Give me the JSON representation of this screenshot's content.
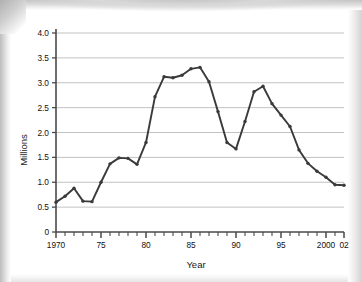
{
  "chart_data": {
    "type": "line",
    "title": "",
    "xlabel": "Year",
    "ylabel": "Millions",
    "xlim": [
      1970,
      2002
    ],
    "ylim": [
      0,
      4.0
    ],
    "grid": true,
    "legend": false,
    "y_ticks": [
      "0",
      "0.5",
      "1.0",
      "1.5",
      "2.0",
      "2.5",
      "3.0",
      "3.5",
      "4.0"
    ],
    "y_tick_values": [
      0,
      0.5,
      1.0,
      1.5,
      2.0,
      2.5,
      3.0,
      3.5,
      4.0
    ],
    "x_ticks": [
      "1970",
      "75",
      "80",
      "85",
      "90",
      "95",
      "2000",
      "02"
    ],
    "x_tick_values": [
      1970,
      1975,
      1980,
      1985,
      1990,
      1995,
      2000,
      2002
    ],
    "x_minor_step": 1,
    "markers": true,
    "line_color": "#3a3a3a",
    "grid_color": "#b3b3b3",
    "axis_color": "#4a4a4a",
    "x": [
      1970,
      1971,
      1972,
      1973,
      1974,
      1975,
      1976,
      1977,
      1978,
      1979,
      1980,
      1981,
      1982,
      1983,
      1984,
      1985,
      1986,
      1987,
      1988,
      1989,
      1990,
      1991,
      1992,
      1993,
      1994,
      1995,
      1996,
      1997,
      1998,
      1999,
      2000,
      2001,
      2002
    ],
    "values": [
      0.6,
      0.72,
      0.88,
      0.62,
      0.61,
      1.0,
      1.37,
      1.49,
      1.48,
      1.36,
      1.8,
      2.72,
      3.12,
      3.1,
      3.15,
      3.28,
      3.31,
      3.02,
      2.42,
      1.8,
      1.67,
      2.22,
      2.82,
      2.93,
      2.58,
      2.35,
      2.12,
      1.65,
      1.38,
      1.22,
      1.1,
      0.95,
      0.94
    ]
  }
}
